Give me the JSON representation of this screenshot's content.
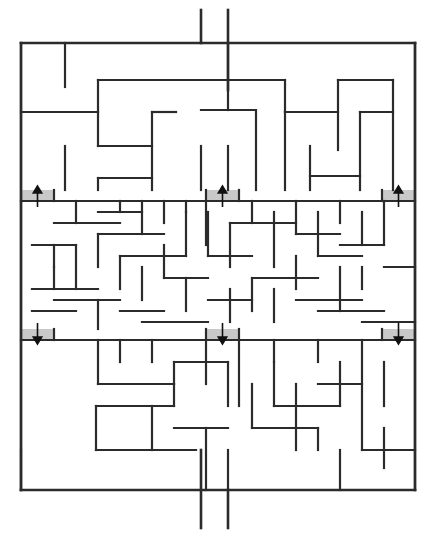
{
  "figure": {
    "kind": "maze-puzzle",
    "title": "",
    "background_color": "#ffffff",
    "wall_color": "#2b2b2b",
    "marker_fill_color": "#c9c9c9",
    "arrow_color": "#111111",
    "canvas": {
      "width": 437,
      "height": 540
    }
  },
  "maze": {
    "origin_x": 21,
    "origin_y": 43,
    "width": 394,
    "height": 447,
    "coarse_cell": 22,
    "fine_cell": 11,
    "columns": 18,
    "rows": 20,
    "entrance_label": "top-corridor",
    "exit_label": "bottom-corridor",
    "entrance": {
      "x1": 201,
      "x2": 228,
      "y_top": 10,
      "y_bottom": 43
    },
    "exit": {
      "x1": 201,
      "x2": 228,
      "y_top": 490,
      "y_bottom": 528
    },
    "border_segments": [
      [
        21,
        43,
        415,
        43
      ],
      [
        21,
        43,
        21,
        490
      ],
      [
        415,
        43,
        415,
        490
      ],
      [
        21,
        490,
        415,
        490
      ]
    ],
    "markers": [
      {
        "name": "up-arrow-left",
        "direction": "up",
        "x": 21,
        "y": 190,
        "w": 33,
        "h": 11
      },
      {
        "name": "up-arrow-center",
        "direction": "up",
        "x": 206,
        "y": 190,
        "w": 33,
        "h": 11
      },
      {
        "name": "up-arrow-right",
        "direction": "up",
        "x": 382,
        "y": 190,
        "w": 33,
        "h": 11
      },
      {
        "name": "down-arrow-left",
        "direction": "down",
        "x": 21,
        "y": 329,
        "w": 33,
        "h": 11
      },
      {
        "name": "down-arrow-center",
        "direction": "down",
        "x": 206,
        "y": 329,
        "w": 33,
        "h": 11
      },
      {
        "name": "down-arrow-right",
        "direction": "down",
        "x": 382,
        "y": 329,
        "w": 33,
        "h": 11
      }
    ],
    "entrance_walls": [
      [
        201,
        10,
        201,
        43
      ],
      [
        228,
        10,
        228,
        90
      ]
    ],
    "exit_walls": [
      [
        201,
        450,
        201,
        528
      ],
      [
        228,
        490,
        228,
        528
      ]
    ],
    "walls": [
      [
        21,
        43,
        21,
        490
      ],
      [
        415,
        43,
        415,
        490
      ],
      [
        21,
        43,
        201,
        43
      ],
      [
        228,
        43,
        415,
        43
      ],
      [
        21,
        490,
        201,
        490
      ],
      [
        228,
        490,
        415,
        490
      ],
      [
        65,
        43,
        65,
        87
      ],
      [
        98,
        80,
        98,
        112
      ],
      [
        98,
        80,
        285,
        80
      ],
      [
        228,
        43,
        228,
        110
      ],
      [
        285,
        80,
        285,
        112
      ],
      [
        338,
        80,
        338,
        150
      ],
      [
        338,
        80,
        393,
        80
      ],
      [
        393,
        80,
        393,
        190
      ],
      [
        21,
        112,
        98,
        112
      ],
      [
        98,
        112,
        98,
        146
      ],
      [
        98,
        146,
        152,
        146
      ],
      [
        152,
        112,
        152,
        190
      ],
      [
        152,
        112,
        176,
        112
      ],
      [
        65,
        146,
        65,
        190
      ],
      [
        98,
        178,
        98,
        190
      ],
      [
        98,
        178,
        152,
        178
      ],
      [
        201,
        146,
        201,
        190
      ],
      [
        228,
        146,
        228,
        190
      ],
      [
        256,
        112,
        256,
        190
      ],
      [
        201,
        110,
        256,
        110
      ],
      [
        285,
        112,
        285,
        190
      ],
      [
        285,
        112,
        338,
        112
      ],
      [
        310,
        146,
        310,
        190
      ],
      [
        310,
        176,
        360,
        176
      ],
      [
        360,
        112,
        360,
        190
      ],
      [
        360,
        112,
        393,
        112
      ],
      [
        21,
        201,
        415,
        201
      ],
      [
        54,
        190,
        54,
        201
      ],
      [
        206,
        190,
        206,
        245
      ],
      [
        239,
        190,
        239,
        201
      ],
      [
        382,
        190,
        382,
        201
      ],
      [
        76,
        201,
        76,
        223
      ],
      [
        54,
        223,
        120,
        223
      ],
      [
        120,
        201,
        120,
        212
      ],
      [
        98,
        212,
        142,
        212
      ],
      [
        142,
        201,
        142,
        234
      ],
      [
        164,
        201,
        164,
        223
      ],
      [
        54,
        245,
        54,
        267
      ],
      [
        32,
        245,
        76,
        245
      ],
      [
        76,
        245,
        76,
        289
      ],
      [
        98,
        234,
        98,
        267
      ],
      [
        98,
        234,
        164,
        234
      ],
      [
        120,
        256,
        186,
        256
      ],
      [
        120,
        256,
        120,
        289
      ],
      [
        142,
        267,
        142,
        300
      ],
      [
        164,
        245,
        164,
        278
      ],
      [
        186,
        212,
        186,
        256
      ],
      [
        186,
        278,
        186,
        311
      ],
      [
        164,
        278,
        208,
        278
      ],
      [
        32,
        289,
        98,
        289
      ],
      [
        54,
        300,
        120,
        300
      ],
      [
        32,
        311,
        76,
        311
      ],
      [
        98,
        300,
        98,
        329
      ],
      [
        120,
        311,
        164,
        311
      ],
      [
        142,
        322,
        208,
        322
      ],
      [
        54,
        267,
        54,
        289
      ],
      [
        186,
        201,
        186,
        212
      ],
      [
        208,
        212,
        208,
        256
      ],
      [
        208,
        256,
        252,
        256
      ],
      [
        230,
        223,
        296,
        223
      ],
      [
        230,
        223,
        230,
        267
      ],
      [
        252,
        201,
        252,
        223
      ],
      [
        274,
        212,
        274,
        267
      ],
      [
        252,
        278,
        318,
        278
      ],
      [
        252,
        278,
        252,
        311
      ],
      [
        274,
        289,
        274,
        322
      ],
      [
        296,
        201,
        296,
        234
      ],
      [
        296,
        234,
        340,
        234
      ],
      [
        318,
        212,
        318,
        256
      ],
      [
        318,
        256,
        362,
        256
      ],
      [
        340,
        201,
        340,
        223
      ],
      [
        340,
        267,
        340,
        311
      ],
      [
        296,
        300,
        362,
        300
      ],
      [
        318,
        311,
        384,
        311
      ],
      [
        362,
        212,
        362,
        245
      ],
      [
        362,
        267,
        362,
        289
      ],
      [
        384,
        201,
        384,
        245
      ],
      [
        340,
        245,
        384,
        245
      ],
      [
        230,
        289,
        230,
        322
      ],
      [
        208,
        300,
        252,
        300
      ],
      [
        296,
        256,
        296,
        289
      ],
      [
        384,
        267,
        415,
        267
      ],
      [
        362,
        322,
        415,
        322
      ],
      [
        21,
        340,
        415,
        340
      ],
      [
        54,
        329,
        54,
        340
      ],
      [
        206,
        329,
        206,
        340
      ],
      [
        239,
        329,
        239,
        340
      ],
      [
        382,
        329,
        382,
        340
      ],
      [
        98,
        340,
        98,
        384
      ],
      [
        120,
        340,
        120,
        362
      ],
      [
        152,
        340,
        152,
        362
      ],
      [
        98,
        384,
        174,
        384
      ],
      [
        174,
        362,
        174,
        384
      ],
      [
        174,
        362,
        228,
        362
      ],
      [
        228,
        362,
        228,
        406
      ],
      [
        206,
        340,
        206,
        384
      ],
      [
        239,
        340,
        239,
        406
      ],
      [
        252,
        384,
        252,
        428
      ],
      [
        274,
        362,
        274,
        406
      ],
      [
        274,
        406,
        340,
        406
      ],
      [
        296,
        384,
        296,
        450
      ],
      [
        152,
        406,
        152,
        450
      ],
      [
        96,
        406,
        174,
        406
      ],
      [
        96,
        406,
        96,
        450
      ],
      [
        96,
        450,
        196,
        450
      ],
      [
        174,
        428,
        228,
        428
      ],
      [
        206,
        428,
        206,
        490
      ],
      [
        228,
        450,
        228,
        490
      ],
      [
        340,
        362,
        340,
        406
      ],
      [
        318,
        384,
        362,
        384
      ],
      [
        362,
        340,
        362,
        450
      ],
      [
        384,
        362,
        384,
        406
      ],
      [
        362,
        450,
        415,
        450
      ],
      [
        384,
        428,
        384,
        468
      ],
      [
        340,
        450,
        340,
        490
      ],
      [
        252,
        428,
        318,
        428
      ],
      [
        318,
        428,
        318,
        450
      ],
      [
        21,
        450,
        21,
        490
      ],
      [
        174,
        384,
        174,
        406
      ],
      [
        274,
        340,
        274,
        362
      ],
      [
        318,
        340,
        318,
        362
      ]
    ]
  }
}
